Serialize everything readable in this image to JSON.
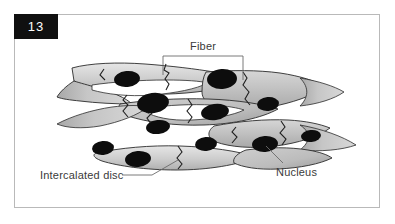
{
  "figure": {
    "number": "13",
    "title_visible": false,
    "frame_color": "#b9b9b9",
    "number_box_color": "#101010",
    "background": "#ffffff"
  },
  "labels": {
    "fiber": "Fiber",
    "intercalated_disc": "Intercalated disc",
    "nucleus": "Nucleus"
  },
  "illustration": {
    "subject": "cardiac-muscle-tissue",
    "cell_fill_light": "#e2e2e2",
    "cell_fill_mid": "#c9c9c9",
    "cell_fill_dark": "#a6a6a6",
    "outline_color": "#2a2a2a",
    "nucleus_color": "#0d0d0d",
    "leader_line_color": "#6b6b6b",
    "nucleus_count": 11,
    "intercalated_disc_count": 9
  }
}
